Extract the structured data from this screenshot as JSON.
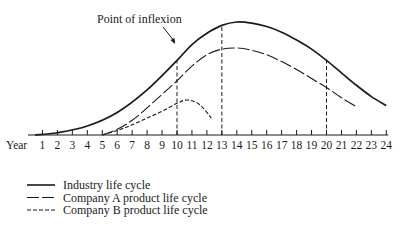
{
  "chart_data": {
    "type": "line",
    "title": "",
    "xlabel": "Year",
    "ylabel": "",
    "x_ticks": [
      1,
      2,
      3,
      4,
      5,
      6,
      7,
      8,
      9,
      10,
      11,
      12,
      13,
      14,
      15,
      16,
      17,
      18,
      19,
      20,
      21,
      22,
      23,
      24
    ],
    "xlim": [
      0.5,
      24
    ],
    "ylim": [
      0,
      100
    ],
    "grid": false,
    "legend_position": "bottom-left",
    "series": [
      {
        "name": "Industry life cycle",
        "style": "solid",
        "points": [
          [
            0.5,
            0
          ],
          [
            2,
            2
          ],
          [
            4,
            8
          ],
          [
            6,
            20
          ],
          [
            8,
            40
          ],
          [
            10,
            66
          ],
          [
            11,
            80
          ],
          [
            12,
            90
          ],
          [
            13,
            97
          ],
          [
            14,
            100
          ],
          [
            15,
            99
          ],
          [
            16,
            96
          ],
          [
            17,
            91
          ],
          [
            18,
            84
          ],
          [
            19,
            76
          ],
          [
            20,
            66
          ],
          [
            21,
            55
          ],
          [
            22,
            44
          ],
          [
            23,
            34
          ],
          [
            24,
            26
          ]
        ]
      },
      {
        "name": "Company A product life cycle",
        "style": "long-dash",
        "points": [
          [
            5,
            0
          ],
          [
            6,
            5
          ],
          [
            7,
            13
          ],
          [
            8,
            24
          ],
          [
            9,
            36
          ],
          [
            10,
            48
          ],
          [
            11,
            61
          ],
          [
            12,
            71
          ],
          [
            13,
            76
          ],
          [
            14,
            77
          ],
          [
            15,
            75
          ],
          [
            16,
            71
          ],
          [
            17,
            65
          ],
          [
            18,
            58
          ],
          [
            19,
            50
          ],
          [
            20,
            42
          ],
          [
            21,
            33
          ],
          [
            22,
            25
          ]
        ]
      },
      {
        "name": "Company B product life cycle",
        "style": "short-dash",
        "points": [
          [
            5,
            0
          ],
          [
            6,
            4
          ],
          [
            7,
            9
          ],
          [
            8,
            15
          ],
          [
            9,
            21
          ],
          [
            10,
            28
          ],
          [
            10.7,
            31
          ],
          [
            11.5,
            27
          ],
          [
            12.3,
            15
          ]
        ]
      }
    ],
    "reference_lines": [
      {
        "x": 10,
        "style": "dashed",
        "to": "Industry life cycle"
      },
      {
        "x": 13,
        "style": "dashed",
        "to": "Industry life cycle"
      },
      {
        "x": 20,
        "style": "dashed",
        "to": "Industry life cycle"
      }
    ],
    "annotations": [
      {
        "text": "Point of inflexion",
        "points_to": {
          "x": 10,
          "series": "Industry life cycle"
        }
      }
    ]
  },
  "labels": {
    "annotation": "Point of inflexion",
    "axis_prefix": "Year",
    "legend": [
      "Industry life cycle",
      "Company A product life cycle",
      "Company B product life cycle"
    ]
  }
}
